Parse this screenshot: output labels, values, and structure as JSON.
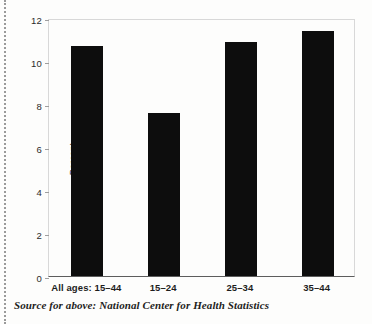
{
  "chart_data": {
    "type": "bar",
    "title": "",
    "subtitle": "",
    "xlabel": "",
    "ylabel": "Percent",
    "categories": [
      "All ages: 15–44",
      "15–24",
      "25–34",
      "35–44"
    ],
    "values": [
      10.7,
      7.6,
      10.9,
      11.4
    ],
    "ylim": [
      0,
      12
    ],
    "yticks": [
      0,
      2,
      4,
      6,
      8,
      10,
      12
    ],
    "ytick_labels": [
      "0",
      "2",
      "4",
      "6",
      "8",
      "10",
      "12"
    ],
    "grid": false,
    "legend": null,
    "bar_color": "#0d0d0d",
    "annotations": []
  },
  "footer": {
    "source": "Source for above: National Center for Health Statistics"
  }
}
